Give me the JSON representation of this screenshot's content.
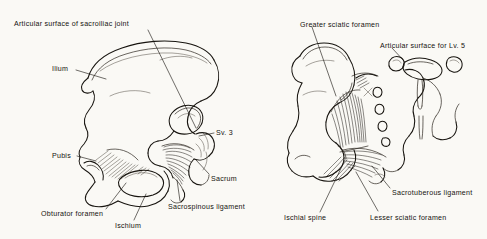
{
  "figure": {
    "background_color": "#faf9f5",
    "ink_color": "#16130f",
    "style": "pen-and-ink anatomical line drawing",
    "panel_count": 2
  },
  "panels": [
    {
      "id": "left-panel",
      "name": "hip-bone-medial-view",
      "description": "Medial aspect of the right hip bone articulated with the sacrum",
      "labels": [
        {
          "id": "articular-surface-sacroiliac",
          "text": "Articular surface of sacroiliac joint",
          "x": 14,
          "y": 21,
          "leader": {
            "x1": 148,
            "y1": 30,
            "x2": 196,
            "y2": 128
          }
        },
        {
          "id": "ilium",
          "text": "Ilium",
          "x": 52,
          "y": 66,
          "leader": {
            "x1": 76,
            "y1": 70,
            "x2": 106,
            "y2": 79
          }
        },
        {
          "id": "sv-3",
          "text": "Sv. 3",
          "x": 216,
          "y": 130,
          "leader": {
            "x1": 214,
            "y1": 133,
            "x2": 199,
            "y2": 136
          }
        },
        {
          "id": "sacrum",
          "text": "Sacrum",
          "x": 211,
          "y": 176,
          "leader": {
            "x1": 209,
            "y1": 174,
            "x2": 196,
            "y2": 160
          }
        },
        {
          "id": "pubis",
          "text": "Pubis",
          "x": 52,
          "y": 153,
          "leader": {
            "x1": 77,
            "y1": 156,
            "x2": 96,
            "y2": 161
          }
        },
        {
          "id": "obturator-foramen",
          "text": "Obturator foramen",
          "x": 41,
          "y": 211,
          "leader": {
            "x1": 106,
            "y1": 209,
            "x2": 126,
            "y2": 183
          }
        },
        {
          "id": "ischium",
          "text": "Ischium",
          "x": 115,
          "y": 223,
          "leader": {
            "x1": 134,
            "y1": 220,
            "x2": 146,
            "y2": 194
          }
        },
        {
          "id": "sacrospinous-ligament",
          "text": "Sacrospinous ligament",
          "x": 168,
          "y": 204,
          "leader": {
            "x1": 180,
            "y1": 201,
            "x2": 177,
            "y2": 180
          }
        }
      ]
    },
    {
      "id": "right-panel",
      "name": "sacrum-ligaments-view",
      "description": "Hip bone with sacrotuberous and sacrospinous ligaments and lumbar vertebra 5",
      "labels": [
        {
          "id": "greater-sciatic-foramen",
          "text": "Greater sciatic foramen",
          "x": 300,
          "y": 22,
          "leader": {
            "x1": 312,
            "y1": 27,
            "x2": 336,
            "y2": 96
          }
        },
        {
          "id": "articular-surface-lv5",
          "text": "Articular surface for Lv. 5",
          "x": 380,
          "y": 43,
          "leader": {
            "x1": 392,
            "y1": 48,
            "x2": 405,
            "y2": 62
          }
        },
        {
          "id": "sacrotuberous-ligament",
          "text": "Sacrotuberous ligament",
          "x": 392,
          "y": 190,
          "leader": {
            "x1": 390,
            "y1": 188,
            "x2": 372,
            "y2": 166
          }
        },
        {
          "id": "ischial-spine",
          "text": "Ischial spine",
          "x": 284,
          "y": 215,
          "leader": {
            "x1": 320,
            "y1": 212,
            "x2": 345,
            "y2": 160
          }
        },
        {
          "id": "lesser-sciatic-foramen",
          "text": "Lesser sciatic foramen",
          "x": 370,
          "y": 215,
          "leader": {
            "x1": 378,
            "y1": 211,
            "x2": 356,
            "y2": 172
          }
        }
      ]
    }
  ],
  "anatomy_terms": [
    "Articular surface of sacroiliac joint",
    "Ilium",
    "Sv. 3",
    "Sacrum",
    "Pubis",
    "Obturator foramen",
    "Ischium",
    "Sacrospinous ligament",
    "Greater sciatic foramen",
    "Articular surface for Lv. 5",
    "Sacrotuberous ligament",
    "Ischial spine",
    "Lesser sciatic foramen"
  ]
}
